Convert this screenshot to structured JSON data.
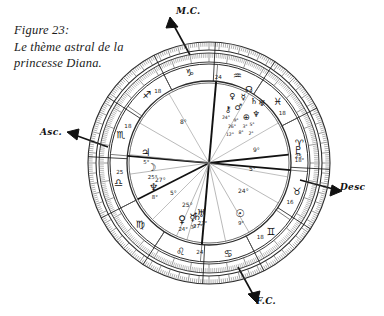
{
  "figure": {
    "caption_line1": "Figure 23:",
    "caption_line2": "Le thème astral de la",
    "caption_line3": "princesse Diana."
  },
  "cardinals": [
    {
      "id": "mc",
      "label": "M.C.",
      "meaning": "Milieu du Ciel / Midheaven",
      "arrow": "up-right"
    },
    {
      "id": "asc",
      "label": "Asc.",
      "meaning": "Ascendant",
      "arrow": "left"
    },
    {
      "id": "desc",
      "label": "Desc",
      "meaning": "Descendant",
      "arrow": "right"
    },
    {
      "id": "fc",
      "label": "F.C.",
      "meaning": "Fond du Ciel / Imum Coeli",
      "arrow": "down"
    }
  ],
  "chart_data": {
    "type": "wheel",
    "title": "Le thème astral de la princesse Diana",
    "center": {
      "cx": 209,
      "cy": 163
    },
    "radii": {
      "rim_outer": 121,
      "rim_inner": 113,
      "tick_band_outer": 110,
      "tick_band_inner": 101,
      "sign_band_outer": 99,
      "sign_band_inner": 82,
      "house_band_outer": 82,
      "aspect_circle": 80
    },
    "ascendant_angle_deg": 185,
    "signs": [
      {
        "glyph": "♏",
        "name": "Scorpio",
        "label_deg": "18",
        "angle": 288
      },
      {
        "glyph": "♎",
        "name": "Libra",
        "label_deg": "25",
        "angle": 258
      },
      {
        "glyph": "♍",
        "name": "Virgo",
        "label_deg": "",
        "angle": 228
      },
      {
        "glyph": "♌",
        "name": "Leo",
        "label_deg": "",
        "angle": 198
      },
      {
        "glyph": "♋",
        "name": "Cancer",
        "label_deg": "",
        "angle": 168
      },
      {
        "glyph": "♊",
        "name": "Gemini",
        "label_deg": "18",
        "angle": 138
      },
      {
        "glyph": "♉",
        "name": "Taurus",
        "label_deg": "16",
        "angle": 108
      },
      {
        "glyph": "♈",
        "name": "Aries",
        "label_deg": "25",
        "angle": 78
      },
      {
        "glyph": "♓",
        "name": "Pisces",
        "label_deg": "18",
        "angle": 48
      },
      {
        "glyph": "♒",
        "name": "Aquarius",
        "label_deg": "",
        "angle": 18
      },
      {
        "glyph": "♑",
        "name": "Capricorn",
        "label_deg": "",
        "angle": 348
      },
      {
        "glyph": "♐",
        "name": "Sagittarius",
        "label_deg": "18",
        "angle": 318
      }
    ],
    "house_cusps_deg": [
      185,
      213,
      243,
      275,
      305,
      333,
      5,
      33,
      63,
      95,
      125,
      153
    ],
    "house_markers": [
      {
        "num": "24",
        "angle": 186,
        "radius": 88
      },
      {
        "num": "24",
        "angle": 6,
        "radius": 88
      }
    ],
    "planets": [
      {
        "glyph": "♆",
        "name": "Neptune",
        "degree": "8°",
        "sign": "♏",
        "angle": 243,
        "radius": 62
      },
      {
        "glyph": "♀",
        "name": "Venus",
        "degree": "24°",
        "sign": "♉",
        "angle": 204,
        "radius": 66
      },
      {
        "glyph": "☿",
        "name": "Mercury",
        "degree": "3°",
        "sign": "♋",
        "angle": 196,
        "radius": 60
      },
      {
        "glyph": "♄",
        "name": "Saturn",
        "degree": "27°",
        "sign": "♑",
        "angle": 192,
        "radius": 58
      },
      {
        "glyph": "♅",
        "name": "Uranus",
        "degree": "23°",
        "sign": "♌",
        "angle": 188,
        "radius": 54
      },
      {
        "glyph": "☉",
        "name": "Sun",
        "degree": "9°",
        "sign": "♋",
        "angle": 150,
        "radius": 62
      },
      {
        "glyph": "☽",
        "name": "Moon",
        "degree": "25°",
        "sign": "♒",
        "angle": 262,
        "radius": 58
      },
      {
        "glyph": "♃",
        "name": "Jupiter",
        "degree": "5°",
        "sign": "♒",
        "angle": 276,
        "radius": 64
      },
      {
        "glyph": "♇",
        "name": "Pluto",
        "degree": "18°",
        "sign": "♍",
        "angle": 84,
        "radius": 90
      }
    ],
    "inner_degree_notes": [
      {
        "text": "27°",
        "x": 155,
        "y": 182
      },
      {
        "text": "5°",
        "x": 170,
        "y": 195
      },
      {
        "text": "25°",
        "x": 182,
        "y": 207
      },
      {
        "text": "24°",
        "x": 238,
        "y": 193
      },
      {
        "text": "9°",
        "x": 253,
        "y": 152
      },
      {
        "text": "5°",
        "x": 249,
        "y": 171
      },
      {
        "text": "8°",
        "x": 180,
        "y": 124
      }
    ],
    "stellium_note": "Dense planet cluster in upper-right quadrant (Cancer/Leo)",
    "grid": false,
    "legend": "none"
  },
  "colors": {
    "ink": "#111111",
    "paper": "#ffffff",
    "line_light": "#8a8a8a",
    "line_mid": "#555555"
  }
}
